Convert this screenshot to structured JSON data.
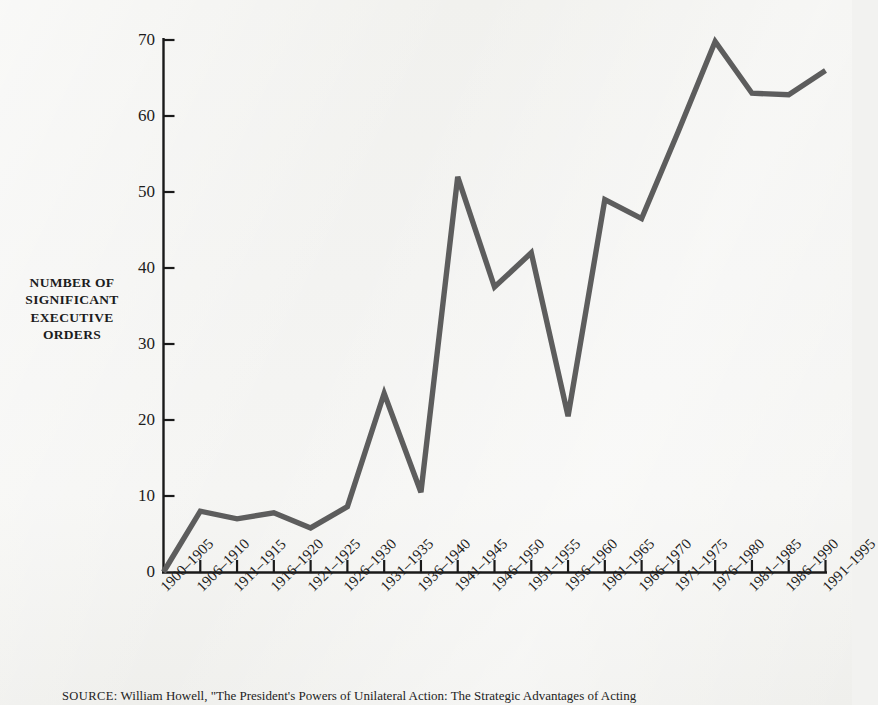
{
  "figure": {
    "y_axis_title_lines": [
      "NUMBER OF",
      "SIGNIFICANT",
      "EXECUTIVE",
      "ORDERS"
    ],
    "source_kicker": "SOURCE:",
    "source_text": "William Howell, \"The President's Powers of Unilateral Action: The Strategic Advantages of Acting"
  },
  "colors": {
    "line": "#5d5d5d",
    "axis": "#1a1a1a",
    "background": "#f3f3f1",
    "text": "#1c1c1c"
  },
  "chart_data": {
    "type": "line",
    "title": "",
    "xlabel": "",
    "ylabel": "NUMBER OF SIGNIFICANT EXECUTIVE ORDERS",
    "ylim": [
      0,
      70
    ],
    "yticks": [
      0,
      10,
      20,
      30,
      40,
      50,
      60,
      70
    ],
    "ytick_labels": [
      "0",
      "10",
      "20",
      "30",
      "40",
      "50",
      "60",
      "70"
    ],
    "grid": false,
    "legend": "none",
    "categories": [
      "1900–1905",
      "1906–1910",
      "1911–1915",
      "1916–1920",
      "1921–1925",
      "1926–1930",
      "1931–1935",
      "1936–1940",
      "1941–1945",
      "1946–1950",
      "1951–1955",
      "1956–1960",
      "1961–1965",
      "1966–1970",
      "1971–1975",
      "1976–1980",
      "1981–1985",
      "1986–1990",
      "1991–1995"
    ],
    "values": [
      0,
      8,
      7,
      7.8,
      5.8,
      8.6,
      23.5,
      10.5,
      52,
      37.5,
      42,
      20.5,
      49,
      46.5,
      58,
      69.8,
      63,
      62.8,
      66
    ]
  }
}
